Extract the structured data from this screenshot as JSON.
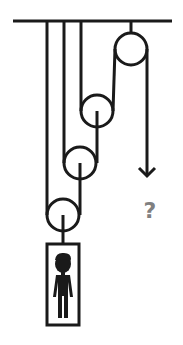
{
  "diagram": {
    "type": "pulley-system",
    "stroke_color": "#1a1a1a",
    "question_color": "#808080",
    "question_label": "?",
    "ceiling": {
      "x1": 13,
      "x2": 172,
      "y": 21
    },
    "pulleys": [
      {
        "name": "fixed-pulley",
        "cx": 131,
        "cy": 49,
        "r": 16
      },
      {
        "name": "movable-pulley-1",
        "cx": 97,
        "cy": 111,
        "r": 16
      },
      {
        "name": "movable-pulley-2",
        "cx": 80,
        "cy": 163,
        "r": 16
      },
      {
        "name": "movable-pulley-3",
        "cx": 63,
        "cy": 215,
        "r": 16
      }
    ],
    "load": {
      "label": "person-in-box",
      "x": 47,
      "y": 244,
      "w": 32,
      "h": 81
    },
    "pull_direction": "down"
  }
}
